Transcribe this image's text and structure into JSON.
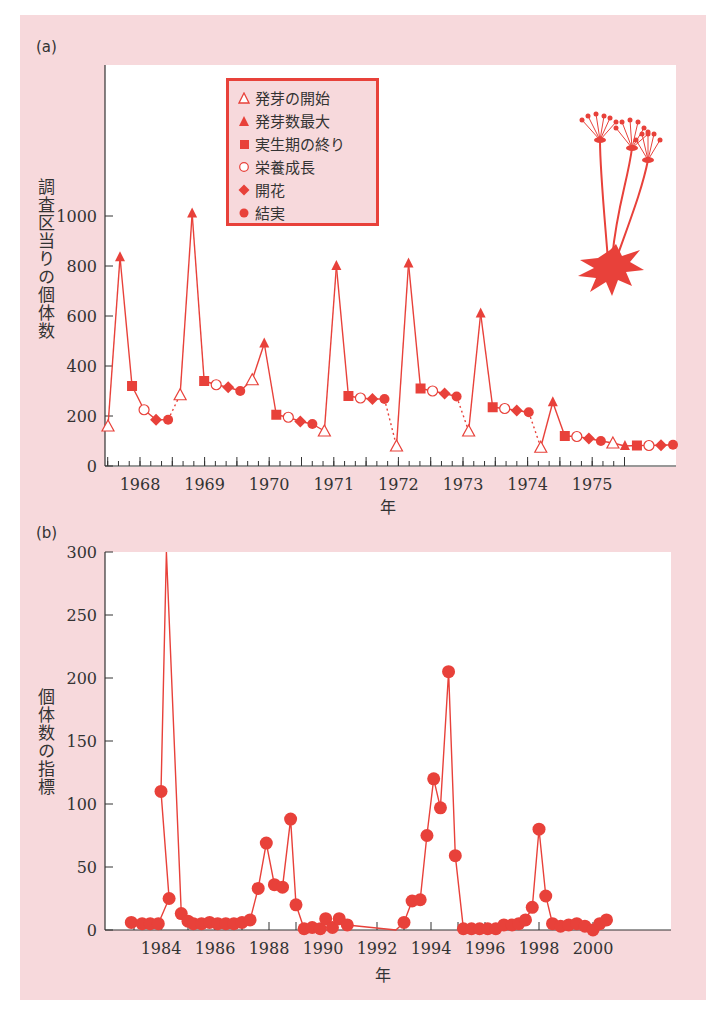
{
  "colors": {
    "accent": "#e8413a",
    "panel_bg": "#f7d9dc",
    "axis": "#333333"
  },
  "panel_a": {
    "label": "(a)",
    "ylabel": "調査区当りの個体数",
    "xlabel": "年",
    "yticks": [
      "0",
      "200",
      "400",
      "600",
      "800",
      "1000"
    ],
    "xticks": [
      "1968",
      "1969",
      "1970",
      "1971",
      "1972",
      "1973",
      "1974",
      "1975"
    ],
    "legend": [
      {
        "symbol": "open-triangle",
        "label": "発芽の開始"
      },
      {
        "symbol": "filled-triangle",
        "label": "発芽数最大"
      },
      {
        "symbol": "filled-square",
        "label": "実生期の終り"
      },
      {
        "symbol": "open-circle",
        "label": "栄養成長"
      },
      {
        "symbol": "filled-diamond",
        "label": "開花"
      },
      {
        "symbol": "filled-circle",
        "label": "結実"
      }
    ]
  },
  "panel_b": {
    "label": "(b)",
    "ylabel": "個体数の指標",
    "xlabel": "年",
    "yticks": [
      "0",
      "50",
      "100",
      "150",
      "200",
      "250",
      "300"
    ],
    "xticks": [
      "1984",
      "1986",
      "1988",
      "1990",
      "1992",
      "1994",
      "1996",
      "1998",
      "2000"
    ]
  },
  "chart_data": [
    {
      "type": "line",
      "title": "(a)",
      "xlabel": "年",
      "ylabel": "調査区当りの個体数",
      "ylim": [
        0,
        1000
      ],
      "xlim": [
        1967.5,
        1975.5
      ],
      "grid": false,
      "legend_position": "upper-left inside",
      "legend": [
        "発芽の開始",
        "発芽数最大",
        "実生期の終り",
        "栄養成長",
        "開花",
        "結実"
      ],
      "points": [
        {
          "x": 1967.55,
          "y": 160,
          "stage": "発芽の開始"
        },
        {
          "x": 1967.75,
          "y": 835,
          "stage": "発芽数最大"
        },
        {
          "x": 1967.98,
          "y": 320,
          "stage": "実生期の終り"
        },
        {
          "x": 1968.2,
          "y": 225,
          "stage": "栄養成長"
        },
        {
          "x": 1968.4,
          "y": 185,
          "stage": "開花"
        },
        {
          "x": 1968.58,
          "y": 185,
          "stage": "結実"
        },
        {
          "x": 1968.8,
          "y": 285,
          "stage": "発芽の開始",
          "dotted_from_prev": true
        },
        {
          "x": 1969.0,
          "y": 1010,
          "stage": "発芽数最大"
        },
        {
          "x": 1969.2,
          "y": 340,
          "stage": "実生期の終り"
        },
        {
          "x": 1969.4,
          "y": 325,
          "stage": "栄養成長"
        },
        {
          "x": 1969.6,
          "y": 315,
          "stage": "開花"
        },
        {
          "x": 1969.8,
          "y": 300,
          "stage": "結実"
        },
        {
          "x": 1970.0,
          "y": 345,
          "stage": "発芽の開始"
        },
        {
          "x": 1970.2,
          "y": 490,
          "stage": "発芽数最大"
        },
        {
          "x": 1970.4,
          "y": 205,
          "stage": "実生期の終り"
        },
        {
          "x": 1970.6,
          "y": 195,
          "stage": "栄養成長"
        },
        {
          "x": 1970.8,
          "y": 178,
          "stage": "開花"
        },
        {
          "x": 1971.0,
          "y": 168,
          "stage": "結実"
        },
        {
          "x": 1971.2,
          "y": 140,
          "stage": "発芽の開始"
        },
        {
          "x": 1971.4,
          "y": 800,
          "stage": "発芽数最大"
        },
        {
          "x": 1971.6,
          "y": 280,
          "stage": "実生期の終り"
        },
        {
          "x": 1971.8,
          "y": 272,
          "stage": "栄養成長"
        },
        {
          "x": 1972.0,
          "y": 268,
          "stage": "開花"
        },
        {
          "x": 1972.15,
          "y": 268,
          "stage": "結実"
        },
        {
          "x": 1972.35,
          "y": 80,
          "stage": "発芽の開始",
          "dotted_from_prev": true
        },
        {
          "x": 1972.55,
          "y": 810,
          "stage": "発芽数最大"
        },
        {
          "x": 1972.75,
          "y": 310,
          "stage": "実生期の終り"
        },
        {
          "x": 1972.95,
          "y": 300,
          "stage": "栄養成長"
        },
        {
          "x": 1973.12,
          "y": 290,
          "stage": "開花"
        },
        {
          "x": 1973.3,
          "y": 278,
          "stage": "結実"
        },
        {
          "x": 1973.5,
          "y": 140,
          "stage": "発芽の開始",
          "dotted_from_prev": true
        },
        {
          "x": 1973.7,
          "y": 610,
          "stage": "発芽数最大"
        },
        {
          "x": 1973.9,
          "y": 235,
          "stage": "実生期の終り"
        },
        {
          "x": 1974.1,
          "y": 230,
          "stage": "栄養成長"
        },
        {
          "x": 1974.28,
          "y": 222,
          "stage": "開花"
        },
        {
          "x": 1974.45,
          "y": 215,
          "stage": "結実"
        },
        {
          "x": 1974.65,
          "y": 75,
          "stage": "発芽の開始",
          "dotted_from_prev": true
        },
        {
          "x": 1974.85,
          "y": 255,
          "stage": "発芽数最大"
        },
        {
          "x": 1975.05,
          "y": 120,
          "stage": "実生期の終り"
        },
        {
          "x": 1975.25,
          "y": 118,
          "stage": "栄養成長"
        },
        {
          "x": 1975.42,
          "y": 110,
          "stage": "開花"
        },
        {
          "x": 1975.6,
          "y": 100,
          "stage": "結実"
        },
        {
          "x": 1975.8,
          "y": 92,
          "stage": "発芽の開始"
        },
        {
          "x": 1976.0,
          "y": 80,
          "stage": "発芽数最大"
        },
        {
          "x": 1976.2,
          "y": 82,
          "stage": "実生期の終り"
        },
        {
          "x": 1976.4,
          "y": 82,
          "stage": "栄養成長"
        },
        {
          "x": 1976.58,
          "y": 83,
          "stage": "開花"
        },
        {
          "x": 1976.75,
          "y": 85,
          "stage": "結実"
        }
      ]
    },
    {
      "type": "line",
      "title": "(b)",
      "xlabel": "年",
      "ylabel": "個体数の指標",
      "ylim": [
        0,
        300
      ],
      "xlim": [
        1982.3,
        2001.0
      ],
      "grid": false,
      "marker": "filled-circle",
      "x": [
        1982.9,
        1983.3,
        1983.6,
        1983.9,
        1984.3,
        1984.0,
        1984.2,
        1984.75,
        1985.0,
        1985.2,
        1985.5,
        1985.8,
        1986.1,
        1986.4,
        1986.7,
        1987.0,
        1987.3,
        1987.6,
        1987.9,
        1988.2,
        1988.5,
        1988.8,
        1989.0,
        1989.3,
        1989.6,
        1989.9,
        1990.1,
        1990.35,
        1990.6,
        1990.9,
        1992.7,
        1993.0,
        1993.3,
        1993.6,
        1993.85,
        1994.1,
        1994.35,
        1994.65,
        1994.9,
        1995.2,
        1995.5,
        1995.8,
        1996.1,
        1996.4,
        1996.7,
        1997.0,
        1997.25,
        1997.5,
        1997.75,
        1998.0,
        1998.25,
        1998.5,
        1998.8,
        1999.1,
        1999.4,
        1999.7,
        2000.0,
        2000.25,
        2000.5
      ],
      "values": [
        6,
        5,
        5,
        5,
        25,
        110,
        300,
        13,
        7,
        5,
        5,
        6,
        5,
        5,
        5,
        6,
        8,
        33,
        69,
        36,
        34,
        88,
        20,
        1,
        2,
        1,
        9,
        2,
        9,
        4,
        0,
        6,
        23,
        24,
        75,
        120,
        97,
        205,
        59,
        1,
        1,
        1,
        1,
        1,
        4,
        4,
        5,
        8,
        18,
        80,
        27,
        5,
        3,
        4,
        5,
        3,
        0,
        5,
        8
      ]
    }
  ]
}
